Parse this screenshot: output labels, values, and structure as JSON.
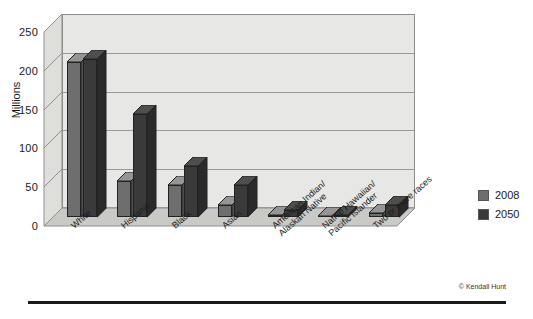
{
  "credit": "© Kendall Hunt",
  "axis": {
    "ylabel": "Millions",
    "yticks": [
      "250",
      "200",
      "150",
      "100",
      "50",
      "0"
    ]
  },
  "legend": {
    "items": [
      {
        "label": "2008",
        "color": "#6e6e6e"
      },
      {
        "label": "2050",
        "color": "#3a3a3a"
      }
    ]
  },
  "chart_data": {
    "type": "bar",
    "title": "",
    "xlabel": "",
    "ylabel": "Millions",
    "ylim": [
      0,
      250
    ],
    "yticks": [
      0,
      50,
      100,
      150,
      200,
      250
    ],
    "grid": true,
    "legend_position": "right",
    "categories": [
      "White",
      "Hispanic",
      "Black",
      "Asian",
      "American Indian/\nAlaskan Native",
      "Native Hawaiian/\nPacific Islander",
      "Two or more races"
    ],
    "series": [
      {
        "name": "2008",
        "color": "#6e6e6e",
        "values": [
          200,
          47,
          41,
          15,
          3,
          1,
          5
        ]
      },
      {
        "name": "2050",
        "color": "#3a3a3a",
        "values": [
          204,
          133,
          66,
          41,
          9,
          3,
          16
        ]
      }
    ]
  }
}
